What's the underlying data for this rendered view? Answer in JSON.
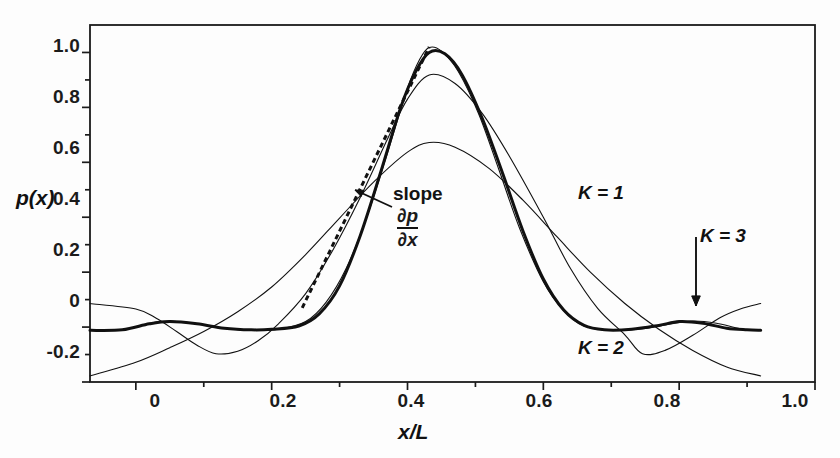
{
  "figure": {
    "background": "#fdfdfd",
    "ink_color": "#111111"
  },
  "chart_data": {
    "type": "line",
    "title": "",
    "subtitle": "",
    "xlabel": "x/L",
    "ylabel": "p(x)",
    "xlim": [
      -0.0675,
      1.0
    ],
    "ylim": [
      -0.2,
      1.1
    ],
    "xticks": [
      0,
      0.2,
      0.4,
      0.6,
      0.8,
      1.0
    ],
    "xticklabels": [
      "0",
      "0.2",
      "0.4",
      "0.6",
      "0.8",
      "1.0"
    ],
    "xminorticks": [
      0.1,
      0.3,
      0.5,
      0.7,
      0.9
    ],
    "yticks": [
      -0.2,
      0,
      0.2,
      0.4,
      0.6,
      0.8,
      1.0
    ],
    "yticklabels": [
      "-0.2",
      "0",
      "0.2",
      "0.4",
      "0.6",
      "0.8",
      "1.0"
    ],
    "yminorticks": [
      -0.1,
      0.1,
      0.3,
      0.5,
      0.7,
      0.9
    ],
    "grid": false,
    "legend_position": "inline-annotations",
    "domain_drawn": [
      -0.0675,
      0.92
    ],
    "peak_x": 0.432,
    "series": [
      {
        "name": "K = 1",
        "kind": "kernel",
        "order": 1,
        "linewidth": 1.1,
        "peak_value": 0.672,
        "endpoint_left": -0.178,
        "endpoint_right": -0.178,
        "x": [
          -0.0675,
          0.0,
          0.05,
          0.1,
          0.15,
          0.2,
          0.25,
          0.3,
          0.35,
          0.4,
          0.432,
          0.47,
          0.52,
          0.57,
          0.62,
          0.67,
          0.72,
          0.77,
          0.82,
          0.87,
          0.92
        ],
        "y": [
          -0.178,
          -0.128,
          -0.075,
          -0.016,
          0.056,
          0.146,
          0.264,
          0.397,
          0.528,
          0.637,
          0.672,
          0.655,
          0.578,
          0.462,
          0.329,
          0.198,
          0.086,
          -0.008,
          -0.085,
          -0.145,
          -0.178
        ]
      },
      {
        "name": "K = 2",
        "kind": "kernel",
        "order": 2,
        "linewidth": 1.1,
        "peak_value": 0.918,
        "endpoint_left": 0.086,
        "endpoint_right": 0.086,
        "side_lobe_min": -0.097,
        "side_lobe_min_x": 0.118,
        "x": [
          -0.0675,
          0.0,
          0.03,
          0.06,
          0.09,
          0.118,
          0.15,
          0.18,
          0.21,
          0.25,
          0.29,
          0.33,
          0.37,
          0.4,
          0.432,
          0.47,
          0.51,
          0.55,
          0.6,
          0.64,
          0.68,
          0.72,
          0.746,
          0.78,
          0.82,
          0.86,
          0.89,
          0.92
        ],
        "y": [
          0.086,
          0.066,
          0.032,
          -0.016,
          -0.066,
          -0.097,
          -0.088,
          -0.05,
          0.012,
          0.122,
          0.28,
          0.47,
          0.682,
          0.83,
          0.918,
          0.887,
          0.778,
          0.622,
          0.4,
          0.213,
          0.068,
          -0.028,
          -0.097,
          -0.084,
          -0.03,
          0.034,
          0.066,
          0.086
        ]
      },
      {
        "name": "K = 3",
        "kind": "kernel",
        "order": 3,
        "linewidth": 3.0,
        "peak_value": 1.0,
        "endpoint_left": -0.012,
        "endpoint_right": -0.012,
        "x": [
          -0.0675,
          -0.02,
          0.02,
          0.05,
          0.09,
          0.13,
          0.17,
          0.2,
          0.24,
          0.27,
          0.3,
          0.33,
          0.36,
          0.39,
          0.412,
          0.432,
          0.455,
          0.48,
          0.51,
          0.54,
          0.57,
          0.6,
          0.63,
          0.66,
          0.69,
          0.73,
          0.77,
          0.8,
          0.835,
          0.87,
          0.9,
          0.92
        ],
        "y": [
          -0.012,
          -0.01,
          0.012,
          0.02,
          0.012,
          -0.004,
          -0.01,
          -0.008,
          0.004,
          0.048,
          0.15,
          0.33,
          0.56,
          0.8,
          0.93,
          1.0,
          0.995,
          0.92,
          0.76,
          0.56,
          0.35,
          0.175,
          0.062,
          0.006,
          -0.01,
          -0.008,
          0.006,
          0.02,
          0.014,
          -0.004,
          -0.01,
          -0.012
        ]
      },
      {
        "name": "K = 3 (thin companion)",
        "kind": "kernel",
        "order": 3,
        "linewidth": 1.1,
        "peak_value": 1.018,
        "endpoint_left": -0.012,
        "endpoint_right": -0.012,
        "x": [
          -0.0675,
          -0.02,
          0.02,
          0.05,
          0.09,
          0.13,
          0.17,
          0.21,
          0.25,
          0.28,
          0.31,
          0.34,
          0.37,
          0.4,
          0.418,
          0.432,
          0.45,
          0.475,
          0.505,
          0.535,
          0.565,
          0.6,
          0.63,
          0.66,
          0.7,
          0.74,
          0.78,
          0.82,
          0.855,
          0.89,
          0.92
        ],
        "y": [
          -0.012,
          -0.01,
          0.014,
          0.022,
          0.012,
          -0.004,
          -0.012,
          -0.008,
          0.02,
          0.09,
          0.215,
          0.4,
          0.63,
          0.87,
          0.975,
          1.018,
          1.005,
          0.93,
          0.775,
          0.57,
          0.36,
          0.165,
          0.06,
          0.004,
          -0.012,
          -0.008,
          0.008,
          0.022,
          0.014,
          -0.006,
          -0.012
        ]
      }
    ],
    "tangent_line": {
      "style": "dashed",
      "label": "slope",
      "expression_numerator": "∂p",
      "expression_denominator": "∂x",
      "x": [
        0.245,
        0.432
      ],
      "y": [
        0.07,
        1.02
      ]
    },
    "annotations": [
      {
        "name": "slope-annotation",
        "text": "slope",
        "sub_numerator": "∂p",
        "sub_denominator": "∂x",
        "x": 0.33,
        "y": 0.5
      },
      {
        "name": "k1-label",
        "text": "K = 1",
        "x": 0.625,
        "y": 0.425
      },
      {
        "name": "k2-label",
        "text": "K = 2",
        "x": 0.625,
        "y": -0.12
      },
      {
        "name": "k3-label",
        "text": "K = 3",
        "x": 0.825,
        "y": 0.265,
        "arrow": {
          "from_y": 0.265,
          "to_y": 0.02
        }
      }
    ]
  },
  "axes": {
    "y_title": "p(x)",
    "x_title": "x/L"
  },
  "labels": {
    "slope_word": "slope",
    "partial_num": "∂p",
    "partial_den": "∂x",
    "k1": "K = 1",
    "k2": "K = 2",
    "k3": "K = 3"
  },
  "ytick_text": [
    "1.0",
    "0.8",
    "0.6",
    "0.4",
    "0.2",
    "0",
    "-0.2"
  ],
  "xtick_text": [
    "0",
    "0.2",
    "0.4",
    "0.6",
    "0.8",
    "1.0"
  ]
}
